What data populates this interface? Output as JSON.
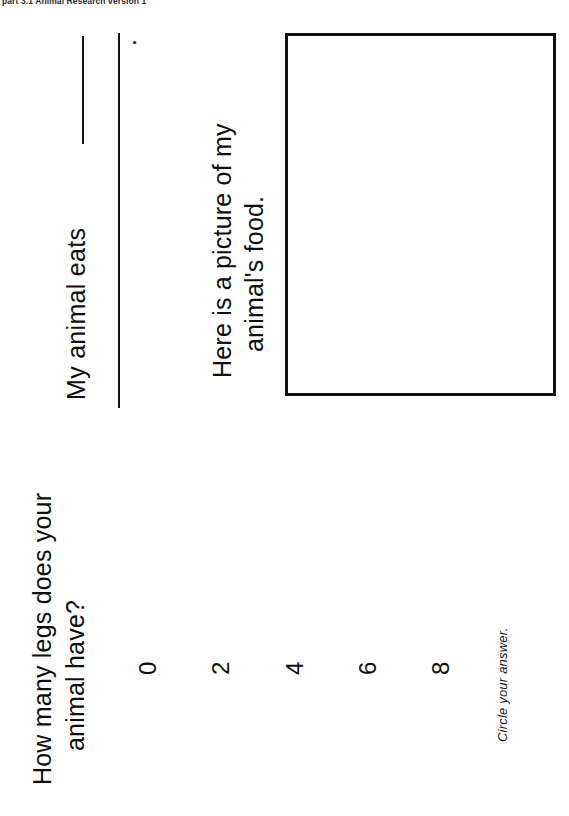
{
  "document": {
    "scan_header": "part 3.1 Animal Research version 1",
    "page_width": 569,
    "page_height": 816,
    "orientation": "landscape-scan-rotated-90-ccw",
    "ink_color": "#111111",
    "paper_color": "#ffffff"
  },
  "food_page": {
    "prompt": "My animal eats",
    "answer_blank": "",
    "end_punctuation": ".",
    "picture_prompt_line1": "Here is a picture of my",
    "picture_prompt_line2": "animal's food.",
    "picture_box_label": "drawing-area",
    "picture_box_content": ""
  },
  "legs_page": {
    "question_line1": "How many legs does your",
    "question_line2": "animal have?",
    "choices": [
      "0",
      "2",
      "4",
      "6",
      "8"
    ],
    "instruction": "Circle your answer."
  }
}
